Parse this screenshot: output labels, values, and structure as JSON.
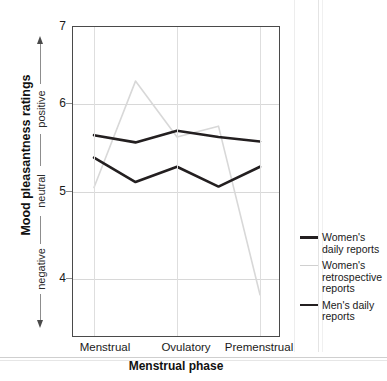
{
  "chart_data": {
    "type": "line",
    "title": "",
    "xlabel": "Menstrual phase",
    "ylabel": "Mood pleasantness ratings",
    "categories": [
      "Menstrual",
      "",
      "Ovulatory",
      "",
      "Premenstrual"
    ],
    "x_tick_labels": [
      "Menstrual",
      "Ovulatory",
      "Premenstrual"
    ],
    "y_tick_labels": [
      "7",
      "6",
      "5",
      "4"
    ],
    "ylim": [
      3.55,
      7.0
    ],
    "yticks": [
      7,
      6,
      5,
      4
    ],
    "grid": "horizontal-and-vertical",
    "legend_position": "right",
    "y_scale_annotations": [
      "positive",
      "neutral",
      "negative"
    ],
    "series": [
      {
        "name": "Women's daily reports",
        "color": "#231f20",
        "width": 2.6,
        "values": [
          5.8,
          5.72,
          5.85,
          5.78,
          5.73
        ]
      },
      {
        "name": "Women's retrospective reports",
        "color": "#d8d8d8",
        "width": 1.6,
        "values": [
          5.22,
          6.4,
          5.78,
          5.9,
          4.03
        ]
      },
      {
        "name": "Men's daily reports",
        "color": "#231f20",
        "width": 2.6,
        "values": [
          5.55,
          5.28,
          5.45,
          5.23,
          5.45
        ]
      }
    ]
  },
  "axes": {
    "y_title": "Mood pleasantness ratings",
    "x_title": "Menstrual phase",
    "y_ticks": [
      {
        "label": "7",
        "value": 7
      },
      {
        "label": "6",
        "value": 6
      },
      {
        "label": "5",
        "value": 5
      },
      {
        "label": "4",
        "value": 4
      }
    ],
    "x_ticks": [
      {
        "label": "Menstrual",
        "index": 0
      },
      {
        "label": "Ovulatory",
        "index": 2
      },
      {
        "label": "Premenstrual",
        "index": 4
      }
    ],
    "scale_words": {
      "positive": "positive",
      "neutral": "neutral",
      "negative": "negative"
    }
  },
  "legend": {
    "items": [
      {
        "label": "Women's daily reports",
        "color": "#231f20",
        "style": "thick"
      },
      {
        "label": "Women's retrospective reports",
        "color": "#d8d8d8",
        "style": "thin"
      },
      {
        "label": "Men's daily reports",
        "color": "#231f20",
        "style": "thick"
      }
    ]
  }
}
